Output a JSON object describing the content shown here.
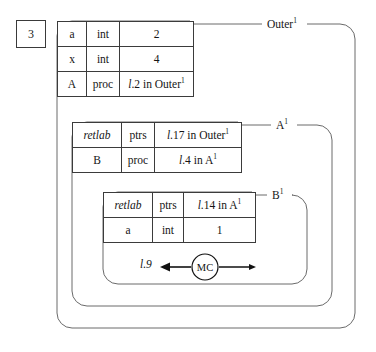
{
  "diagram": {
    "step_number": "3",
    "line_color": "#6a6a6a",
    "table_border_color": "#3b3b3b",
    "text_color": "#151515",
    "background": "#ffffff"
  },
  "scopes": [
    {
      "id": "outer",
      "label": "Outer",
      "superscript": "1"
    },
    {
      "id": "a",
      "label": "A",
      "superscript": "1"
    },
    {
      "id": "b",
      "label": "B",
      "superscript": "1"
    }
  ],
  "tables": {
    "outer": {
      "name": "outer-symbol-table",
      "rows": [
        {
          "name": "a",
          "kind": "int",
          "value": "2"
        },
        {
          "name": "x",
          "kind": "int",
          "value": "4"
        },
        {
          "name": "A",
          "kind": "proc",
          "value_italic": "l",
          "value": ".2 in Outer",
          "value_sup": "1"
        }
      ]
    },
    "a": {
      "name": "a-symbol-table",
      "rows": [
        {
          "name": "retlab",
          "name_italic": true,
          "kind": "ptrs",
          "value_italic": "l",
          "value": ".17 in Outer",
          "value_sup": "1"
        },
        {
          "name": "B",
          "name_italic": false,
          "kind": "proc",
          "value_italic": "l",
          "value": ".4 in A",
          "value_sup": "1"
        }
      ]
    },
    "b": {
      "name": "b-symbol-table",
      "rows": [
        {
          "name": "retlab",
          "name_italic": true,
          "kind": "ptrs",
          "value_italic": "l",
          "value": ".14 in A",
          "value_sup": "1"
        },
        {
          "name": "a",
          "name_italic": false,
          "kind": "int",
          "value": "1"
        }
      ]
    }
  },
  "mc_node": {
    "label": "MC",
    "left_target_italic": "l",
    "left_target": ".9"
  }
}
